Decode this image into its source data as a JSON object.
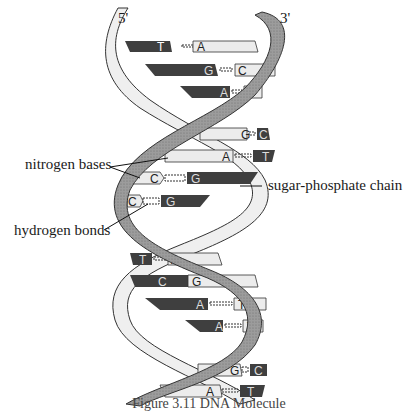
{
  "strand_labels": {
    "five_prime": "5'",
    "three_prime": "3'"
  },
  "annotations": {
    "nitrogen_bases": "nitrogen bases",
    "hydrogen_bonds": "hydrogen bonds",
    "sugar_phosphate_chain": "sugar-phosphate chain"
  },
  "caption": "Figure 3.11 DNA Molecule",
  "base_pairs": [
    {
      "left": "T",
      "right": "A"
    },
    {
      "left": "G",
      "right": "C"
    },
    {
      "left": "A",
      "right": "T"
    },
    {
      "left": "G",
      "right": "C"
    },
    {
      "left": "A",
      "right": "T"
    },
    {
      "left": "C",
      "right": "G"
    },
    {
      "left": "C",
      "right": "G"
    },
    {
      "left": "T",
      "right": "A"
    },
    {
      "left": "C",
      "right": "G"
    },
    {
      "left": "A",
      "right": "T"
    },
    {
      "left": "A",
      "right": "T"
    },
    {
      "left": "G",
      "right": "C"
    },
    {
      "left": "A",
      "right": "T"
    }
  ],
  "colors": {
    "dark_base": "#3f3f3f",
    "light_base": "#ececec",
    "strand_dark": "#9a9a9a",
    "strand_light": "#eeeeee",
    "outline": "#333333"
  }
}
